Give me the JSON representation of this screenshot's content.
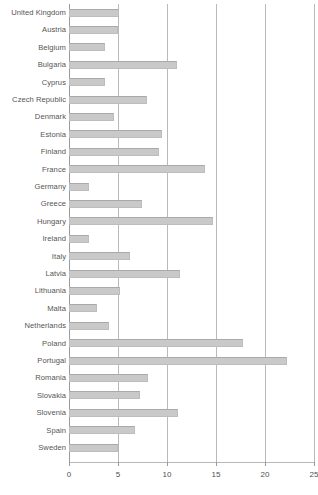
{
  "chart_data": {
    "type": "bar",
    "orientation": "horizontal",
    "title": "",
    "subtitle": "",
    "xlabel": "",
    "ylabel": "",
    "xlim": [
      0,
      25
    ],
    "ylim": null,
    "grid": true,
    "legend": null,
    "legend_position": "none",
    "xticks": [
      0,
      5,
      10,
      15,
      20,
      25
    ],
    "xtick_labels": [
      "0",
      "5",
      "10",
      "15",
      "20",
      "25"
    ],
    "bar_color": "#c9c9c9",
    "bar_edge_color": "#bdbdbd",
    "gridline_color": "#b9b9b9",
    "label_color": "#555555",
    "categories": [
      "United Kingdom",
      "Austria",
      "Belgium",
      "Bulgaria",
      "Cyprus",
      "Czech Republic",
      "Denmark",
      "Estonia",
      "Finland",
      "France",
      "Germany",
      "Greece",
      "Hungary",
      "Ireland",
      "Italy",
      "Latvia",
      "Lithuania",
      "Malta",
      "Netherlands",
      "Poland",
      "Portugal",
      "Romania",
      "Slovakia",
      "Slovenia",
      "Spain",
      "Sweden"
    ],
    "values": [
      5.1,
      5.0,
      3.7,
      11.0,
      3.7,
      8.0,
      4.6,
      9.5,
      9.2,
      13.9,
      2.0,
      7.4,
      14.7,
      2.0,
      6.2,
      11.3,
      5.2,
      2.9,
      4.1,
      17.8,
      22.2,
      8.1,
      7.2,
      11.1,
      6.7,
      5.0
    ]
  }
}
